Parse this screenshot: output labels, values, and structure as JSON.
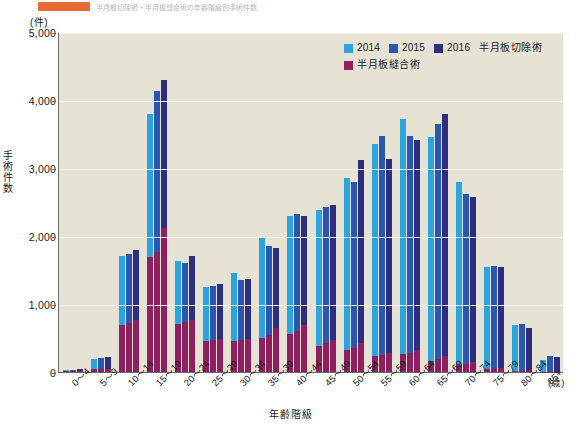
{
  "caption": {
    "chip_color": "#e8622a",
    "text": "半月板切除術・半月板縫合術の年齢階級別手術件数"
  },
  "legend": {
    "items": [
      {
        "label": "2014",
        "color": "#2ba4e0",
        "name": "legend-2014"
      },
      {
        "label": "2015",
        "color": "#2a55b0",
        "name": "legend-2015"
      },
      {
        "label": "2016",
        "color": "#2d2f7e",
        "name": "legend-2016"
      }
    ],
    "series_primary": "半月板切除術",
    "suture": {
      "label": "半月板縫合術",
      "color": "#8e2060"
    }
  },
  "axes": {
    "y_unit": "(件)",
    "y_title": "手術件数",
    "x_title": "年齢階級",
    "x_unit": "(歳)",
    "y_ticks": [
      "5,000",
      "4,000",
      "3,000",
      "2,000",
      "1,000",
      "0"
    ]
  },
  "chart_data": {
    "type": "bar",
    "title": "半月板切除術・半月板縫合術の年齢階級別手術件数",
    "xlabel": "年齢階級",
    "ylabel": "手術件数",
    "yunit": "(件)",
    "xunit": "(歳)",
    "ylim": [
      0,
      5000
    ],
    "ytick_step": 1000,
    "grid": true,
    "legend_position": "top-right",
    "stacked": true,
    "stack_note": "各年の棒は下段=半月板縫合術、上段=半月板切除術の積み上げ",
    "categories": [
      "0〜4",
      "5〜9",
      "10〜14",
      "15〜19",
      "20〜24",
      "25〜29",
      "30〜34",
      "35〜39",
      "40〜44",
      "45〜49",
      "50〜54",
      "55〜59",
      "60〜64",
      "65〜69",
      "70〜74",
      "75〜79",
      "80〜84",
      "85+"
    ],
    "series": [
      {
        "name": "2014 合計",
        "color": "#2ba4e0",
        "values": [
          30,
          190,
          1700,
          3800,
          1640,
          1250,
          1460,
          1990,
          2290,
          2380,
          2860,
          3350,
          3720,
          3450,
          2790,
          1540,
          690,
          170
        ]
      },
      {
        "name": "2015 合計",
        "color": "#2a55b0",
        "values": [
          35,
          205,
          1740,
          4130,
          1600,
          1270,
          1350,
          1850,
          2330,
          2420,
          2800,
          3470,
          3470,
          3650,
          2620,
          1560,
          700,
          230
        ]
      },
      {
        "name": "2016 合計",
        "color": "#2d2f7e",
        "values": [
          40,
          215,
          1790,
          4290,
          1700,
          1290,
          1370,
          1830,
          2300,
          2460,
          3120,
          3140,
          3410,
          3800,
          2570,
          1540,
          650,
          225
        ]
      }
    ],
    "suture_series": [
      {
        "name": "2014 半月板縫合術",
        "color": "#8e2060",
        "values": [
          8,
          40,
          690,
          1690,
          710,
          460,
          450,
          500,
          560,
          380,
          330,
          230,
          260,
          160,
          110,
          45,
          20,
          5
        ]
      },
      {
        "name": "2015 半月板縫合術",
        "color": "#8e2060",
        "values": [
          9,
          45,
          720,
          1760,
          740,
          470,
          470,
          540,
          600,
          420,
          360,
          250,
          280,
          190,
          120,
          50,
          22,
          6
        ]
      },
      {
        "name": "2016 半月板縫合術",
        "color": "#8e2060",
        "values": [
          10,
          50,
          760,
          2120,
          770,
          480,
          490,
          640,
          690,
          470,
          420,
          280,
          320,
          230,
          140,
          55,
          25,
          7
        ]
      }
    ]
  }
}
